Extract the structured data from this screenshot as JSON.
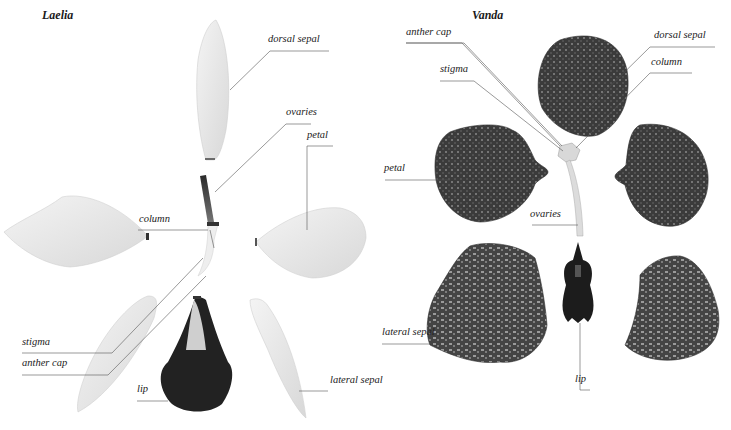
{
  "diagram": {
    "left": {
      "title": "Laelia",
      "labels": {
        "dorsal_sepal": "dorsal sepal",
        "ovaries": "ovaries",
        "petal": "petal",
        "column": "column",
        "stigma": "stigma",
        "anther_cap": "anther cap",
        "lip": "lip",
        "lateral_sepal": "lateral sepal"
      }
    },
    "right": {
      "title": "Vanda",
      "labels": {
        "anther_cap": "anther cap",
        "stigma": "stigma",
        "dorsal_sepal": "dorsal sepal",
        "column": "column",
        "petal": "petal",
        "ovaries": "ovaries",
        "lateral_sepal": "lateral sepal",
        "lip": "lip"
      }
    },
    "colors": {
      "background": "#ffffff",
      "leader_line": "#555555",
      "laelia_petal": "#ececec",
      "vanda_petal": "#3a3a3a",
      "lip_dark": "#1c1c1c"
    }
  }
}
